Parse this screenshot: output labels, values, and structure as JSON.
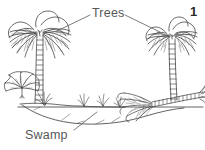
{
  "figure": {
    "number": "1",
    "medium": "black-and-white line drawing",
    "background_color": "#ffffff",
    "ink_color": "#3a3a3a",
    "label_color": "#575757"
  },
  "labels": [
    {
      "id": "trees",
      "text": "Trees",
      "x": 92,
      "y": 7,
      "leader_lines": [
        {
          "from_x": 90,
          "from_y": 14,
          "to_x": 57,
          "to_y": 30
        },
        {
          "from_x": 124,
          "from_y": 14,
          "to_x": 158,
          "to_y": 31
        }
      ]
    },
    {
      "id": "swamp",
      "text": "Swamp",
      "x": 25,
      "y": 129,
      "leader_lines": [
        {
          "from_x": 74,
          "from_y": 130,
          "to_x": 96,
          "to_y": 112
        }
      ]
    }
  ],
  "scene_elements": [
    {
      "name": "palm-tree-left",
      "description": "tall palm tree with segmented trunk and wide frond crown",
      "x": 8,
      "y": 10,
      "width": 70,
      "height": 95
    },
    {
      "name": "palm-tree-right",
      "description": "shorter palm tree with segmented trunk and frond crown",
      "x": 140,
      "y": 14,
      "width": 60,
      "height": 85
    },
    {
      "name": "fan-palm-bush",
      "description": "small low fan-palm shrub at lower left",
      "x": 4,
      "y": 74,
      "width": 38,
      "height": 32
    },
    {
      "name": "fallen-palm",
      "description": "fallen palm trunk with fronds leaning into the water on the right",
      "x": 118,
      "y": 88,
      "width": 85,
      "height": 32
    },
    {
      "name": "grass-tuft-left",
      "description": "grass tuft beside left palm trunk",
      "x": 38,
      "y": 92,
      "width": 14,
      "height": 14
    },
    {
      "name": "grass-tuft-mid-a",
      "description": "grass tuft on bank",
      "x": 80,
      "y": 94,
      "width": 10,
      "height": 12
    },
    {
      "name": "grass-tuft-mid-b",
      "description": "grass tuft on bank",
      "x": 100,
      "y": 94,
      "width": 10,
      "height": 12
    },
    {
      "name": "grass-tuft-right",
      "description": "grass tuft at right water edge",
      "x": 118,
      "y": 96,
      "width": 10,
      "height": 12
    },
    {
      "name": "waterline",
      "description": "horizontal swamp water surface line",
      "x": 18,
      "y": 106,
      "width": 185,
      "height": 2
    },
    {
      "name": "near-bank",
      "description": "curved foreground bank edge of the swamp",
      "x": 22,
      "y": 107,
      "width": 175,
      "height": 18
    }
  ]
}
